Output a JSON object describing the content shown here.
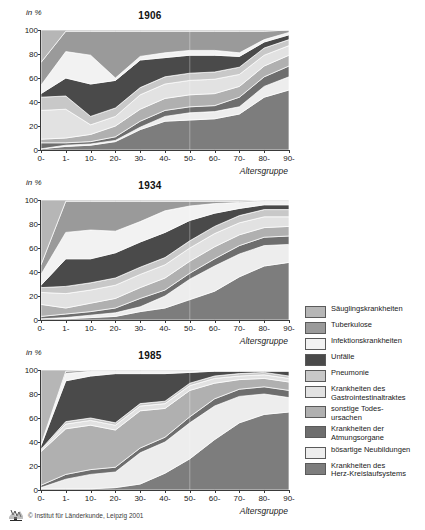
{
  "figure": {
    "axis_caption": "Altersgruppe",
    "yaxis_unit": "in %",
    "credit": "© Institut für Länderkunde, Leipzig 2001",
    "logo_name": "institut-fuer-laenderkunde-logo"
  },
  "legend": {
    "items": [
      {
        "label": "Säuglingskrankheiten",
        "color": "#b6b6b6"
      },
      {
        "label": "Tuberkulose",
        "color": "#9a9a9a"
      },
      {
        "label": "Infektionskrankheiten",
        "color": "#f2f2f2"
      },
      {
        "label": "Unfälle",
        "color": "#4a4a4a"
      },
      {
        "label": "Pneumonie",
        "color": "#c8c8c8"
      },
      {
        "label": "Krankheiten des\nGastrointestinaltraktes",
        "color": "#e2e2e2"
      },
      {
        "label": "sonstige Todes-\nursachen",
        "color": "#b0b0b0"
      },
      {
        "label": "Krankheiten der\nAtmungsorgane",
        "color": "#6e6e6e"
      },
      {
        "label": "bösartige Neubildungen",
        "color": "#ededed"
      },
      {
        "label": "Krankheiten des\nHerz-Kreislaufsystems",
        "color": "#7d7d7d"
      }
    ]
  },
  "chart_data": {
    "type": "area",
    "stacked": "percent",
    "xlabel": "Altersgruppe",
    "ylabel": "in %",
    "ylim": [
      0,
      100
    ],
    "yticks": [
      0,
      20,
      40,
      60,
      80,
      100
    ],
    "grid": false,
    "legend_position": "right",
    "categories": [
      "0-",
      "1-",
      "10-",
      "20-",
      "30-",
      "40-",
      "50-",
      "60-",
      "70-",
      "80-",
      "90-"
    ],
    "series_order": [
      "Krankheiten des Herz-Kreislaufsystems",
      "bösartige Neubildungen",
      "Krankheiten der Atmungsorgane",
      "sonstige Todesursachen",
      "Krankheiten des Gastrointestinaltraktes",
      "Pneumonie",
      "Unfälle",
      "Infektionskrankheiten",
      "Tuberkulose",
      "Säuglingskrankheiten"
    ],
    "panels": [
      {
        "title": "1906",
        "series": [
          {
            "name": "Krankheiten des Herz-Kreislaufsystems",
            "color": "#7d7d7d",
            "values": [
              1,
              3,
              4,
              7,
              17,
              24,
              25,
              26,
              30,
              44,
              50
            ]
          },
          {
            "name": "bösartige Neubildungen",
            "color": "#ededed",
            "values": [
              0,
              1,
              1,
              1,
              2,
              4,
              6,
              6,
              6,
              9,
              11
            ]
          },
          {
            "name": "Krankheiten der Atmungsorgane",
            "color": "#6e6e6e",
            "values": [
              5,
              2,
              2,
              3,
              5,
              5,
              5,
              5,
              8,
              8,
              9
            ]
          },
          {
            "name": "sonstige Todesursachen",
            "color": "#b0b0b0",
            "values": [
              3,
              4,
              6,
              9,
              10,
              10,
              10,
              10,
              9,
              9,
              9
            ]
          },
          {
            "name": "Krankheiten des Gastrointestinaltraktes",
            "color": "#e2e2e2",
            "values": [
              24,
              24,
              8,
              8,
              12,
              12,
              12,
              12,
              10,
              9,
              8
            ]
          },
          {
            "name": "Pneumonie",
            "color": "#c8c8c8",
            "values": [
              11,
              11,
              7,
              7,
              6,
              6,
              6,
              6,
              6,
              6,
              5
            ]
          },
          {
            "name": "Unfälle",
            "color": "#4a4a4a",
            "values": [
              3,
              15,
              27,
              23,
              23,
              16,
              15,
              14,
              9,
              5,
              4
            ]
          },
          {
            "name": "Infektionskrankheiten",
            "color": "#f2f2f2",
            "values": [
              7,
              22,
              24,
              2,
              3,
              4,
              4,
              4,
              3,
              2,
              2
            ]
          },
          {
            "name": "Tuberkulose",
            "color": "#9a9a9a",
            "values": [
              19,
              17,
              20,
              39,
              21,
              18,
              16,
              16,
              18,
              7,
              2
            ]
          },
          {
            "name": "Säuglingskrankheiten",
            "color": "#b6b6b6",
            "values": [
              27,
              1,
              1,
              1,
              1,
              1,
              1,
              1,
              1,
              1,
              0
            ]
          }
        ]
      },
      {
        "title": "1934",
        "series": [
          {
            "name": "Krankheiten des Herz-Kreislaufsystems",
            "color": "#7d7d7d",
            "values": [
              1,
              1,
              2,
              3,
              7,
              10,
              17,
              24,
              36,
              45,
              48
            ]
          },
          {
            "name": "bösartige Neubildungen",
            "color": "#ededed",
            "values": [
              0,
              1,
              2,
              3,
              4,
              10,
              17,
              21,
              19,
              17,
              15
            ]
          },
          {
            "name": "Krankheiten der Atmungsorgane",
            "color": "#6e6e6e",
            "values": [
              2,
              3,
              3,
              4,
              7,
              5,
              5,
              6,
              7,
              7,
              7
            ]
          },
          {
            "name": "sonstige Todesursachen",
            "color": "#b0b0b0",
            "values": [
              10,
              5,
              7,
              8,
              9,
              10,
              10,
              10,
              9,
              8,
              8
            ]
          },
          {
            "name": "Krankheiten des Gastrointestinaltraktes",
            "color": "#e2e2e2",
            "values": [
              10,
              12,
              11,
              11,
              11,
              11,
              11,
              11,
              10,
              9,
              8
            ]
          },
          {
            "name": "Pneumonie",
            "color": "#c8c8c8",
            "values": [
              4,
              6,
              6,
              6,
              6,
              6,
              6,
              6,
              6,
              6,
              6
            ]
          },
          {
            "name": "Unfälle",
            "color": "#4a4a4a",
            "values": [
              2,
              23,
              20,
              21,
              21,
              21,
              17,
              11,
              6,
              4,
              4
            ]
          },
          {
            "name": "Infektionskrankheiten",
            "color": "#f2f2f2",
            "values": [
              9,
              22,
              24,
              18,
              17,
              18,
              12,
              8,
              5,
              3,
              3
            ]
          },
          {
            "name": "Tuberkulose",
            "color": "#9a9a9a",
            "values": [
              8,
              26,
              24,
              25,
              17,
              8,
              4,
              2,
              1,
              1,
              1
            ]
          },
          {
            "name": "Säuglingskrankheiten",
            "color": "#b6b6b6",
            "values": [
              54,
              1,
              1,
              1,
              1,
              1,
              1,
              1,
              1,
              0,
              0
            ]
          }
        ]
      },
      {
        "title": "1985",
        "series": [
          {
            "name": "Krankheiten des Herz-Kreislaufsystems",
            "color": "#7d7d7d",
            "values": [
              1,
              1,
              1,
              2,
              5,
              14,
              26,
              42,
              56,
              63,
              65
            ]
          },
          {
            "name": "bösartige Neubildungen",
            "color": "#ededed",
            "values": [
              1,
              8,
              12,
              13,
              26,
              26,
              30,
              28,
              22,
              17,
              12
            ]
          },
          {
            "name": "Krankheiten der Atmungsorgane",
            "color": "#6e6e6e",
            "values": [
              2,
              4,
              4,
              4,
              4,
              4,
              5,
              6,
              6,
              6,
              6
            ]
          },
          {
            "name": "sonstige Todesursachen",
            "color": "#b0b0b0",
            "values": [
              28,
              38,
              37,
              31,
              31,
              24,
              22,
              13,
              8,
              7,
              7
            ]
          },
          {
            "name": "Krankheiten des Gastrointestinaltraktes",
            "color": "#e2e2e2",
            "values": [
              1,
              4,
              4,
              4,
              4,
              4,
              4,
              4,
              3,
              3,
              3
            ]
          },
          {
            "name": "Pneumonie",
            "color": "#c8c8c8",
            "values": [
              1,
              2,
              2,
              2,
              2,
              2,
              2,
              2,
              2,
              2,
              2
            ]
          },
          {
            "name": "Unfälle",
            "color": "#4a4a4a",
            "values": [
              3,
              34,
              35,
              41,
              25,
              23,
              9,
              4,
              2,
              1,
              4
            ]
          },
          {
            "name": "Infektionskrankheiten",
            "color": "#f2f2f2",
            "values": [
              1,
              6,
              4,
              2,
              2,
              2,
              1,
              1,
              1,
              1,
              1
            ]
          },
          {
            "name": "Tuberkulose",
            "color": "#9a9a9a",
            "values": [
              0,
              2,
              1,
              1,
              1,
              1,
              1,
              0,
              0,
              0,
              0
            ]
          },
          {
            "name": "Säuglingskrankheiten",
            "color": "#b6b6b6",
            "values": [
              62,
              1,
              0,
              0,
              0,
              0,
              0,
              0,
              0,
              0,
              0
            ]
          }
        ]
      }
    ]
  }
}
